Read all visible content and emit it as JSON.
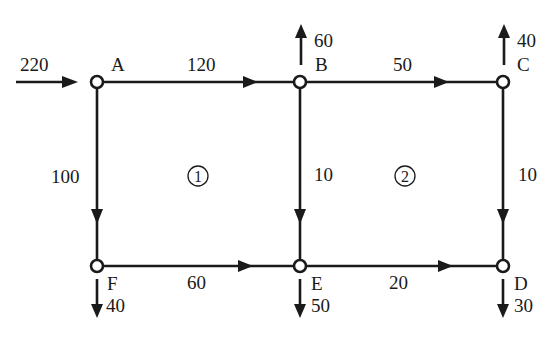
{
  "diagram": {
    "type": "pipe-network-flow",
    "nodes": [
      {
        "id": "A",
        "label": "A",
        "x": 97,
        "y": 82
      },
      {
        "id": "B",
        "label": "B",
        "x": 300,
        "y": 82
      },
      {
        "id": "C",
        "label": "C",
        "x": 503,
        "y": 82
      },
      {
        "id": "D",
        "label": "D",
        "x": 503,
        "y": 266
      },
      {
        "id": "E",
        "label": "E",
        "x": 300,
        "y": 266
      },
      {
        "id": "F",
        "label": "F",
        "x": 97,
        "y": 266
      }
    ],
    "edges": [
      {
        "from": "A",
        "to": "B",
        "flow": "120"
      },
      {
        "from": "B",
        "to": "C",
        "flow": "50"
      },
      {
        "from": "A",
        "to": "F",
        "flow": "100"
      },
      {
        "from": "B",
        "to": "E",
        "flow": "10"
      },
      {
        "from": "C",
        "to": "D",
        "flow": "10"
      },
      {
        "from": "F",
        "to": "E",
        "flow": "60"
      },
      {
        "from": "E",
        "to": "D",
        "flow": "20"
      }
    ],
    "external_flows": [
      {
        "node": "A",
        "direction": "in",
        "value": "220"
      },
      {
        "node": "B",
        "direction": "out-up",
        "value": "60"
      },
      {
        "node": "C",
        "direction": "out-up",
        "value": "40"
      },
      {
        "node": "F",
        "direction": "out-down",
        "value": "40"
      },
      {
        "node": "E",
        "direction": "out-down",
        "value": "50"
      },
      {
        "node": "D",
        "direction": "out-down",
        "value": "30"
      }
    ],
    "loops": [
      {
        "label": "1"
      },
      {
        "label": "2"
      }
    ],
    "line_color": "#1a1a1a"
  }
}
